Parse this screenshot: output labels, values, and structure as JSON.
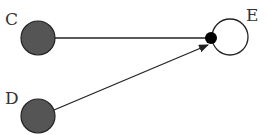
{
  "diagram": {
    "nodes": [
      {
        "id": "C",
        "label": "C",
        "cx": 38,
        "cy": 38,
        "r": 17,
        "fill": "#555555",
        "label_x": 5,
        "label_y": 25
      },
      {
        "id": "D",
        "label": "D",
        "cx": 38,
        "cy": 116,
        "r": 17,
        "fill": "#555555",
        "label_x": 5,
        "label_y": 104
      },
      {
        "id": "E",
        "label": "E",
        "cx": 230,
        "cy": 37,
        "r": 18,
        "fill": "#ffffff",
        "label_x": 246,
        "label_y": 21
      }
    ],
    "junction": {
      "cx": 211,
      "cy": 38,
      "r": 6,
      "fill": "#000000"
    },
    "edges": [
      {
        "from": "C",
        "to": "E",
        "type": "line"
      },
      {
        "from": "D",
        "to": "E",
        "type": "arrow"
      }
    ],
    "colors": {
      "stroke": "#222222",
      "node_dark": "#555555"
    }
  }
}
